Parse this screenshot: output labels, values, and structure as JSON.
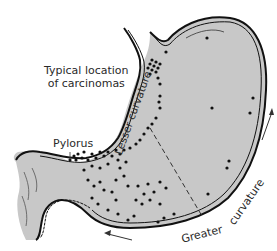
{
  "diagram": {
    "labels": {
      "typical_location_line1": "Typical location",
      "typical_location_line2": "of carcinomas",
      "pylorus": "Pylorus",
      "lesser_curvature": "Lesser curvature",
      "greater": "Greater",
      "curvature": "curvature"
    },
    "colors": {
      "stomach_fill": "#c8c8c8",
      "outline": "#111111",
      "dots": "#111111",
      "text": "#2a2a2a",
      "background": "#ffffff"
    },
    "arrows": [
      {
        "name": "greater-curvature-arrow-up",
        "direction": "up-right"
      },
      {
        "name": "greater-curvature-arrow-left",
        "direction": "left"
      }
    ]
  }
}
